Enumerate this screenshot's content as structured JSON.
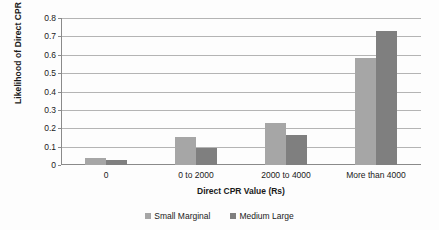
{
  "chart_data": {
    "type": "bar",
    "title": "",
    "subtitle": "",
    "xlabel": "Direct CPR Value (Rs)",
    "ylabel": "Likelihood of Direct CPR value states",
    "categories": [
      "0",
      "0 to 2000",
      "2000 to 4000",
      "More than 4000"
    ],
    "series": [
      {
        "name": "Small Marginal",
        "color": "#a6a6a6",
        "values": [
          0.04,
          0.15,
          0.23,
          0.58
        ]
      },
      {
        "name": "Medium Large",
        "color": "#7f7f7f",
        "values": [
          0.025,
          0.09,
          0.165,
          0.73
        ]
      }
    ],
    "ylim": [
      0,
      0.8
    ],
    "ytick_values": [
      0,
      0.1,
      0.2,
      0.3,
      0.4,
      0.5,
      0.6,
      0.7,
      0.8
    ],
    "ytick_labels": [
      "0",
      "0.1",
      "0.2",
      "0.3",
      "0.4",
      "0.5",
      "0.6",
      "0.7",
      "0.8"
    ],
    "grid": true,
    "grid_axis": "y",
    "legend_position": "bottom",
    "gridline_color": "#b4b4b4",
    "axis_color": "#8a8a8a",
    "background_color": "#fdfdfd"
  }
}
